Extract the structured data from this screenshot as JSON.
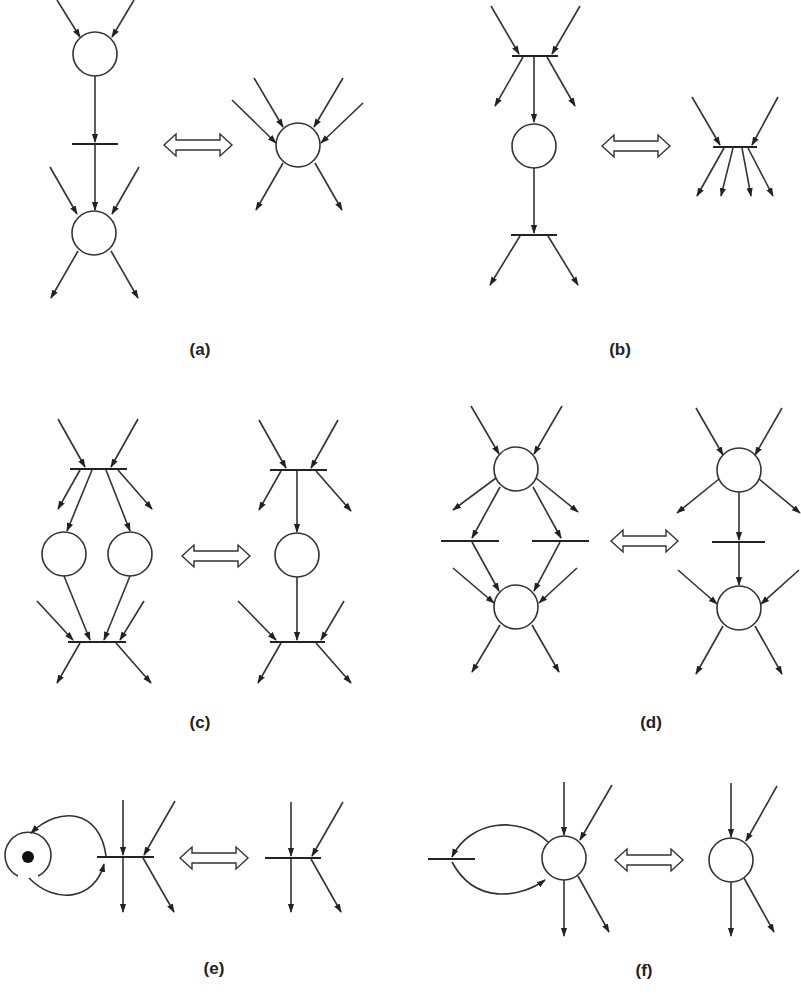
{
  "figure": {
    "panels": [
      {
        "id": "a",
        "label": "(a)",
        "rule": "Fusion of series places: place -> transition -> place equals a single place"
      },
      {
        "id": "b",
        "label": "(b)",
        "rule": "Fusion of series transitions: transition -> place -> transition equals a single transition"
      },
      {
        "id": "c",
        "label": "(c)",
        "rule": "Fusion of parallel places equals a single place"
      },
      {
        "id": "d",
        "label": "(d)",
        "rule": "Fusion of parallel transitions equals a single transition"
      },
      {
        "id": "e",
        "label": "(e)",
        "rule": "Elimination of self-loop place (marked) equals transition alone"
      },
      {
        "id": "f",
        "label": "(f)",
        "rule": "Elimination of self-loop transition equals place alone"
      }
    ],
    "equivalence_symbol": "double-headed-arrow",
    "colors": {
      "stroke": "#333333",
      "background": "#ffffff",
      "token": "#111111"
    }
  }
}
